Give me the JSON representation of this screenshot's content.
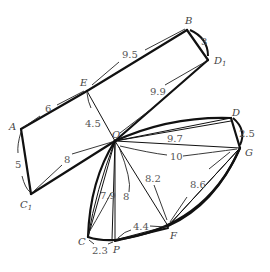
{
  "points": {
    "A": {
      "label": "A",
      "x": 21,
      "y": 129
    },
    "E": {
      "label": "E",
      "x": 87,
      "y": 91
    },
    "B": {
      "label": "B",
      "x": 187,
      "y": 30
    },
    "D1": {
      "label": "D",
      "sub": "1",
      "x": 208,
      "y": 60
    },
    "O": {
      "label": "O",
      "x": 115,
      "y": 141
    },
    "C1": {
      "label": "C",
      "sub": "1",
      "x": 31,
      "y": 194
    },
    "D": {
      "label": "D",
      "x": 231,
      "y": 118
    },
    "G": {
      "label": "G",
      "x": 240,
      "y": 148
    },
    "C": {
      "label": "C",
      "x": 88,
      "y": 237
    },
    "P": {
      "label": "P",
      "x": 115,
      "y": 240
    },
    "F": {
      "label": "F",
      "x": 168,
      "y": 226
    }
  },
  "distances": {
    "AE": "6",
    "EB": "9.5",
    "BD1": "3",
    "OD1": "9.9",
    "EO": "4.5",
    "AC1": "5",
    "C1O": "8",
    "OD": "9.7",
    "DG": "2.5",
    "OG": "10",
    "OF": "8.2",
    "FG": "8.6",
    "OC": "7.9",
    "OP": "8",
    "PF": "4.4",
    "CP": "2.3"
  }
}
